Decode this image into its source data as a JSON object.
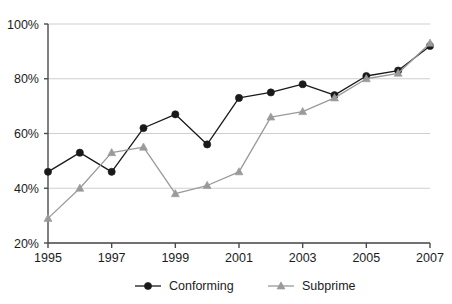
{
  "chart_data": {
    "type": "line",
    "title": "",
    "subtitle": "",
    "xlabel": "",
    "ylabel": "",
    "x": [
      1995,
      1996,
      1997,
      1998,
      1999,
      2000,
      2001,
      2002,
      2003,
      2004,
      2005,
      2006,
      2007
    ],
    "categories": [
      "1995",
      "1996",
      "1997",
      "1998",
      "1999",
      "2000",
      "2001",
      "2002",
      "2003",
      "2004",
      "2005",
      "2006",
      "2007"
    ],
    "series": [
      {
        "name": "Conforming",
        "marker": "circle",
        "color": "#1a1a1a",
        "values": [
          46,
          53,
          46,
          62,
          67,
          56,
          73,
          75,
          78,
          74,
          81,
          83,
          92
        ]
      },
      {
        "name": "Subprime",
        "marker": "triangle",
        "color": "#9a9a9a",
        "values": [
          29,
          40,
          53,
          55,
          38,
          41,
          46,
          66,
          68,
          73,
          80,
          82,
          93
        ]
      }
    ],
    "xlim": [
      1995,
      2007
    ],
    "ylim": [
      20,
      100
    ],
    "yticks": [
      20,
      40,
      60,
      80,
      100
    ],
    "ytick_labels": [
      "20%",
      "40%",
      "60%",
      "80%",
      "100%"
    ],
    "xticks": [
      1995,
      1997,
      1999,
      2001,
      2003,
      2005,
      2007
    ],
    "xtick_labels": [
      "1995",
      "1997",
      "1999",
      "2001",
      "2003",
      "2005",
      "2007"
    ],
    "grid": {
      "horizontal": true,
      "vertical": false,
      "color": "#cfcfcf"
    },
    "legend": {
      "position": "bottom",
      "entries": [
        {
          "label": "Conforming",
          "color": "#1a1a1a",
          "marker": "circle"
        },
        {
          "label": "Subprime",
          "color": "#9a9a9a",
          "marker": "triangle"
        }
      ]
    },
    "axis_color": "#4a4a4a"
  }
}
